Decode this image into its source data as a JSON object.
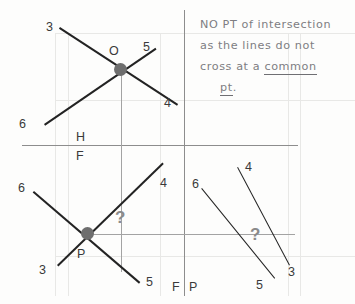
{
  "sheet": {
    "title": "Descriptive geometry worksheet - intersection of lines"
  },
  "annotation": {
    "line1": "NO  PT  of  intersection",
    "line2": "as  the  lines  do  not",
    "line3_plain": "cross    at  a   ",
    "line3_underlined": "common",
    "line4_underlined": "pt",
    "line4_tail": "."
  },
  "fold_labels": {
    "above_horizontal": "H",
    "below_horizontal": "F",
    "left_of_vertical": "F",
    "right_of_vertical": "P"
  },
  "points": {
    "top_view_point": "O",
    "front_view_point": "P"
  },
  "views": {
    "top_left": {
      "name": "top-view",
      "endpoint_labels": [
        "3",
        "5",
        "4",
        "6"
      ]
    },
    "bottom_left": {
      "name": "front-view",
      "endpoint_labels": [
        "4",
        "6",
        "3",
        "5"
      ]
    },
    "bottom_right": {
      "name": "profile-view",
      "endpoint_labels": [
        "4",
        "6",
        "3",
        "5"
      ]
    }
  },
  "query_marks": {
    "front_view": "?",
    "profile_view": "?"
  },
  "colors": {
    "paper": "#fdfdfc",
    "object_line": "#232323",
    "reference_line": "#8d8d8d",
    "guide_line": "#e8e8e6",
    "dot": "#6e6e6e",
    "pencil_text": "#7e7e82",
    "label_text": "#3a3a3a"
  }
}
